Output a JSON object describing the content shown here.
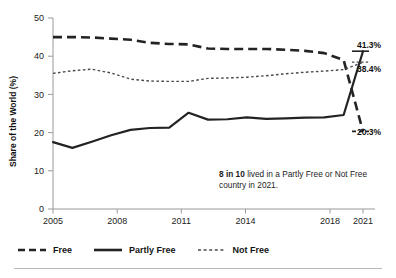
{
  "chart_data": {
    "type": "line",
    "title": "",
    "xlabel": "",
    "ylabel": "Share of the World (%)",
    "ylim": [
      0,
      50
    ],
    "xlim": [
      2005,
      2021
    ],
    "yticks": [
      0,
      10,
      20,
      30,
      40,
      50
    ],
    "xticks": [
      2005,
      2008,
      2011,
      2014,
      2018,
      2021
    ],
    "xtick_labels": [
      "2005",
      "2008",
      "2011",
      "2014",
      "2018",
      "2021"
    ],
    "ytick_labels": [
      "0",
      "10",
      "20",
      "30",
      "40",
      "50"
    ],
    "grid": false,
    "legend_position": "bottom",
    "x": [
      2005,
      2006,
      2007,
      2008,
      2009,
      2010,
      2011,
      2012,
      2013,
      2014,
      2015,
      2016,
      2017,
      2018,
      2019,
      2020,
      2021
    ],
    "series": [
      {
        "name": "Free",
        "style": "dashed",
        "color": "#232323",
        "values": [
          45.0,
          45.0,
          44.9,
          44.6,
          44.3,
          43.5,
          43.2,
          43.1,
          42.0,
          41.9,
          41.9,
          41.9,
          41.7,
          41.4,
          40.8,
          39.0,
          20.3
        ],
        "end_label": "20.3%"
      },
      {
        "name": "Partly Free",
        "style": "solid",
        "color": "#232323",
        "values": [
          17.5,
          16.0,
          17.6,
          19.3,
          20.7,
          21.2,
          21.3,
          25.2,
          23.4,
          23.5,
          24.0,
          23.6,
          23.7,
          23.9,
          24.0,
          24.6,
          41.3
        ],
        "end_label": "41.3%"
      },
      {
        "name": "Not Free",
        "style": "dotted",
        "color": "#4a4a4a",
        "values": [
          35.5,
          36.2,
          36.6,
          35.6,
          34.0,
          33.5,
          33.4,
          33.4,
          34.2,
          34.3,
          34.5,
          34.9,
          35.4,
          35.8,
          36.1,
          36.5,
          38.4
        ],
        "end_label": "38.4%"
      }
    ],
    "annotations": [
      {
        "id": "share-callout",
        "bold_prefix": "8 in 10",
        "text": " lived in a Partly Free or Not Free country in 2021."
      }
    ]
  },
  "legend": {
    "items": [
      {
        "label": "Free",
        "style": "dashed"
      },
      {
        "label": "Partly Free",
        "style": "solid"
      },
      {
        "label": "Not Free",
        "style": "dotted"
      }
    ]
  }
}
